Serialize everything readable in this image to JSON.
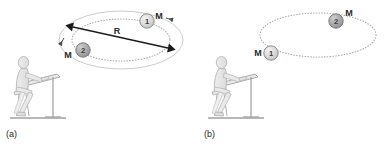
{
  "figure": {
    "background_color": "#ffffff",
    "colors": {
      "ellipse_outer": "#c9c9c9",
      "ellipse_dotted": "#b0b0b0",
      "arrow": "#1a1a1a",
      "ball_light_fill": "#d5d5d5",
      "ball_dark_fill": "#a8a8a8",
      "ball_stroke": "#8c8c8c",
      "person_fill": "#e4e4e4",
      "person_stroke": "#b4b4b4",
      "desk_stroke": "#9a9a9a",
      "text": "#2b2b2b"
    }
  },
  "panels": [
    {
      "id": "a",
      "caption": "(a)",
      "orbit": {
        "type": "double-ellipse",
        "outer_style": "solid",
        "inner_style": "dotted"
      },
      "radius_label": "R",
      "bodies": [
        {
          "id": "ball-1",
          "number": "1",
          "mass_label": "M",
          "position": "upper-right",
          "shade": "light"
        },
        {
          "id": "ball-2",
          "number": "2",
          "mass_label": "M",
          "position": "lower-left",
          "shade": "dark"
        }
      ],
      "observer": {
        "name": "seated-observer",
        "description": "person seated at drafting table"
      }
    },
    {
      "id": "b",
      "caption": "(b)",
      "orbit": {
        "type": "single-ellipse",
        "outer_style": "dotted",
        "inner_style": "none"
      },
      "radius_label": "",
      "bodies": [
        {
          "id": "ball-1",
          "number": "1",
          "mass_label": "M",
          "position": "lower-left",
          "shade": "light"
        },
        {
          "id": "ball-2",
          "number": "2",
          "mass_label": "M",
          "position": "upper-right",
          "shade": "dark"
        }
      ],
      "observer": {
        "name": "seated-observer",
        "description": "person seated at drafting table"
      }
    }
  ]
}
